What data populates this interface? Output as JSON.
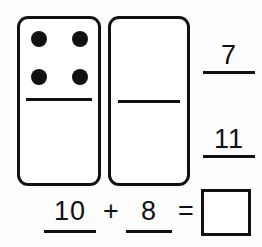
{
  "worksheet": {
    "title": "Domino addition worksheet",
    "colors": {
      "ink": "#111111",
      "paper": "#fdfdfd",
      "tile": "#ffffff"
    }
  },
  "dominoes": [
    {
      "name": "left-domino",
      "top_half": {
        "pip_count": 4,
        "pips_visible": true
      },
      "bottom_half": {
        "pip_count": 0,
        "pips_visible": false
      }
    },
    {
      "name": "right-domino",
      "top_half": {
        "pip_count": 0,
        "pips_visible": false
      },
      "bottom_half": {
        "pip_count": 0,
        "pips_visible": false
      }
    }
  ],
  "side_blanks": [
    {
      "name": "top-side-blank",
      "value": "7"
    },
    {
      "name": "bottom-side-blank",
      "value": "11"
    }
  ],
  "equation": {
    "addend_1": "10",
    "operator": "+",
    "addend_2": "8",
    "equals": "=",
    "answer": ""
  }
}
